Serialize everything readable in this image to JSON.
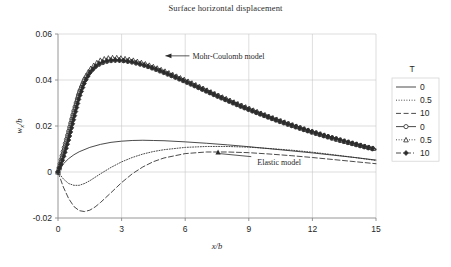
{
  "chart_data": {
    "type": "line",
    "title": "Surface horizontal displacement",
    "xlabel": "x /b",
    "ylabel": "w x /b",
    "xlim": [
      0,
      15
    ],
    "ylim": [
      -0.02,
      0.06
    ],
    "xticks": [
      "0",
      "3",
      "6",
      "9",
      "12",
      "15"
    ],
    "xtick_values": [
      0,
      3,
      6,
      9,
      12,
      15
    ],
    "yticks": [
      "-0.02",
      "0",
      "0.02",
      "0.04",
      "0.06"
    ],
    "ytick_values": [
      -0.02,
      0,
      0.02,
      0.04,
      0.06
    ],
    "grid": true,
    "legend_position": "right-outside",
    "legend_title": "T",
    "annotations": [
      {
        "text": "Mohr-Coulomb model",
        "x": 6.2,
        "y": 0.0505
      },
      {
        "text": "Elastic model",
        "x": 9.4,
        "y": 0.0045
      }
    ],
    "series": [
      {
        "name": "0",
        "group": "Elastic model",
        "style": "solid",
        "marker": "none",
        "color": "#2b2b2b",
        "x": [
          0,
          0.25,
          0.5,
          0.75,
          1,
          1.5,
          2,
          2.5,
          3,
          3.5,
          4,
          4.5,
          5,
          6,
          7,
          8,
          9,
          10,
          11,
          12,
          13,
          14,
          15
        ],
        "y": [
          0,
          0.0035,
          0.0058,
          0.0075,
          0.0088,
          0.0107,
          0.012,
          0.0129,
          0.0134,
          0.0137,
          0.0138,
          0.0137,
          0.0136,
          0.0131,
          0.0125,
          0.0118,
          0.011,
          0.0101,
          0.0092,
          0.0083,
          0.0073,
          0.0063,
          0.0052
        ]
      },
      {
        "name": "0.5",
        "group": "Elastic model",
        "style": "dotted",
        "marker": "none",
        "color": "#2b2b2b",
        "x": [
          0,
          0.25,
          0.5,
          0.75,
          1,
          1.25,
          1.5,
          2,
          2.5,
          3,
          3.5,
          4,
          4.5,
          5,
          6,
          7,
          8,
          9,
          10,
          11,
          12,
          13,
          14,
          15
        ],
        "y": [
          0,
          -0.003,
          -0.005,
          -0.0058,
          -0.0058,
          -0.005,
          -0.0038,
          -0.0008,
          0.002,
          0.0044,
          0.0063,
          0.0078,
          0.0089,
          0.0097,
          0.0107,
          0.0111,
          0.0111,
          0.0108,
          0.0102,
          0.0095,
          0.0086,
          0.0075,
          0.0063,
          0.005
        ]
      },
      {
        "name": "10",
        "group": "Elastic model",
        "style": "dashed",
        "marker": "none",
        "color": "#2b2b2b",
        "x": [
          0,
          0.25,
          0.5,
          0.75,
          1,
          1.25,
          1.5,
          1.75,
          2,
          2.5,
          3,
          3.5,
          4,
          4.5,
          5,
          6,
          7,
          8,
          9,
          10,
          11,
          12,
          13,
          14,
          15
        ],
        "y": [
          0,
          -0.0065,
          -0.0115,
          -0.015,
          -0.0168,
          -0.0172,
          -0.0166,
          -0.0152,
          -0.0133,
          -0.009,
          -0.0046,
          -0.0008,
          0.0022,
          0.0045,
          0.0061,
          0.008,
          0.0087,
          0.0087,
          0.0084,
          0.0078,
          0.0071,
          0.0063,
          0.0054,
          0.0045,
          0.0036
        ]
      },
      {
        "name": "0",
        "group": "Mohr-Coulomb model",
        "style": "solid",
        "marker": "circle",
        "color": "#2b2b2b",
        "x": [
          0,
          0.25,
          0.5,
          0.75,
          1,
          1.25,
          1.5,
          1.75,
          2,
          2.25,
          2.5,
          2.75,
          3,
          3.5,
          4,
          4.5,
          5,
          5.5,
          6,
          6.5,
          7,
          7.5,
          8,
          8.5,
          9,
          9.5,
          10,
          10.5,
          11,
          11.5,
          12,
          12.5,
          13,
          13.5,
          14,
          14.5,
          15
        ],
        "y": [
          0,
          0.009,
          0.0175,
          0.0265,
          0.0345,
          0.04,
          0.0435,
          0.0458,
          0.0472,
          0.048,
          0.0484,
          0.0486,
          0.0485,
          0.0478,
          0.0466,
          0.045,
          0.0432,
          0.0413,
          0.0393,
          0.0372,
          0.0351,
          0.033,
          0.031,
          0.029,
          0.0271,
          0.0253,
          0.0235,
          0.0218,
          0.0202,
          0.0187,
          0.0172,
          0.0158,
          0.0145,
          0.0132,
          0.012,
          0.0108,
          0.0097
        ]
      },
      {
        "name": "0.5",
        "group": "Mohr-Coulomb model",
        "style": "dotted",
        "marker": "triangle",
        "color": "#2b2b2b",
        "x": [
          0,
          0.25,
          0.5,
          0.75,
          1,
          1.25,
          1.5,
          1.75,
          2,
          2.25,
          2.5,
          2.75,
          3,
          3.5,
          4,
          4.5,
          5,
          5.5,
          6,
          6.5,
          7,
          7.5,
          8,
          8.5,
          9,
          9.5,
          10,
          10.5,
          11,
          11.5,
          12,
          12.5,
          13,
          13.5,
          14,
          14.5,
          15
        ],
        "y": [
          0,
          0.0085,
          0.017,
          0.0262,
          0.0348,
          0.0408,
          0.0446,
          0.047,
          0.0486,
          0.0494,
          0.0497,
          0.0497,
          0.0495,
          0.0487,
          0.0474,
          0.0458,
          0.044,
          0.042,
          0.04,
          0.0379,
          0.0357,
          0.0336,
          0.0316,
          0.0296,
          0.0277,
          0.0258,
          0.024,
          0.0223,
          0.0207,
          0.0191,
          0.0176,
          0.0162,
          0.0148,
          0.0135,
          0.0123,
          0.0111,
          0.01
        ]
      },
      {
        "name": "10",
        "group": "Mohr-Coulomb model",
        "style": "dashdot",
        "marker": "diamond",
        "color": "#2b2b2b",
        "x": [
          0,
          0.25,
          0.5,
          0.75,
          1,
          1.25,
          1.5,
          1.75,
          2,
          2.25,
          2.5,
          2.75,
          3,
          3.5,
          4,
          4.5,
          5,
          5.5,
          6,
          6.5,
          7,
          7.5,
          8,
          8.5,
          9,
          9.5,
          10,
          10.5,
          11,
          11.5,
          12,
          12.5,
          13,
          13.5,
          14,
          14.5,
          15
        ],
        "y": [
          0,
          0.0062,
          0.014,
          0.0235,
          0.0325,
          0.039,
          0.0432,
          0.0458,
          0.0474,
          0.0482,
          0.0486,
          0.0487,
          0.0486,
          0.0479,
          0.0467,
          0.0452,
          0.0434,
          0.0415,
          0.0395,
          0.0374,
          0.0353,
          0.0332,
          0.0312,
          0.0292,
          0.0273,
          0.0255,
          0.0237,
          0.022,
          0.0204,
          0.0189,
          0.0174,
          0.016,
          0.0147,
          0.0134,
          0.0122,
          0.011,
          0.0099
        ]
      }
    ]
  },
  "legend": {
    "title": "T",
    "entries": [
      {
        "label": "0",
        "style": "solid",
        "marker": "none"
      },
      {
        "label": "0.5",
        "style": "dotted",
        "marker": "none"
      },
      {
        "label": "10",
        "style": "dashed",
        "marker": "none"
      },
      {
        "label": "0",
        "style": "solid",
        "marker": "circle"
      },
      {
        "label": "0.5",
        "style": "dotted",
        "marker": "triangle"
      },
      {
        "label": "10",
        "style": "dashdot",
        "marker": "diamond"
      }
    ]
  },
  "colors": {
    "line": "#2b2b2b",
    "grid": "#c8c8c8",
    "axis": "#8a8a8a",
    "text": "#262626",
    "background": "#ffffff"
  }
}
